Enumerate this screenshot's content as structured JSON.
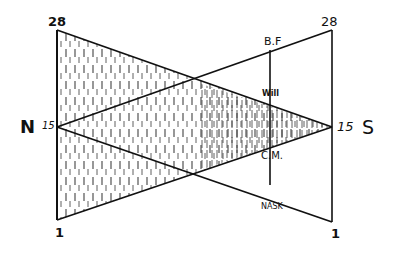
{
  "diagram": {
    "type": "hand-drawn geometric projection diagram",
    "colors": {
      "ink": "#111111",
      "background": "#ffffff",
      "hatch": "#333333"
    },
    "left_scale": {
      "top_label": "28",
      "bottom_label": "1",
      "middle_label": "15"
    },
    "right_scale": {
      "top_label": "28",
      "bottom_label": "1",
      "middle_label": "15"
    },
    "poles": {
      "left": "N",
      "right": "S"
    },
    "middle_line_labels": {
      "top": "B.F",
      "upper_crossing": "Will",
      "lower_crossing": "C.M.",
      "bottom": "NASK"
    },
    "shading": "vertical dashed hatching fills the region between the 28→15 and 1→15 lines (left triangle tapering to S)"
  }
}
